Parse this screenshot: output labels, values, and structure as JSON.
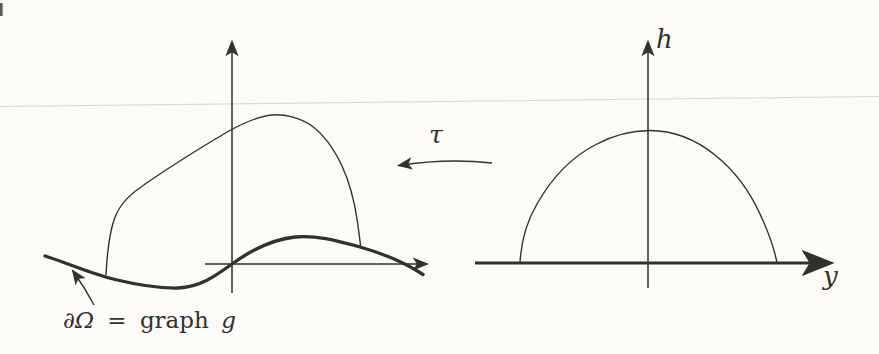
{
  "figure": {
    "left_diagram": {
      "boundary_label": {
        "partial_omega": "∂Ω",
        "equals": "=",
        "graph_word": "graph",
        "g_function": "g"
      }
    },
    "mapping": {
      "tau": "τ"
    },
    "right_diagram": {
      "vertical_axis_label": "h",
      "horizontal_axis_label": "y"
    }
  },
  "colors": {
    "ink": "#33312e",
    "background": "#fcfbf8",
    "scan_line": "#dbdad5",
    "edge_artifact": "#3a3a38"
  }
}
